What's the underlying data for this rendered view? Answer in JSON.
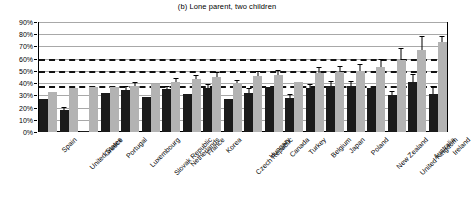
{
  "chart_data": {
    "type": "bar",
    "title": "(b) Lone parent, two children",
    "xlabel": "",
    "ylabel": "",
    "ylim": [
      0,
      90
    ],
    "ytick_labels": [
      "0%",
      "10%",
      "20%",
      "30%",
      "40%",
      "50%",
      "60%",
      "70%",
      "80%",
      "90%"
    ],
    "ytick_values": [
      0,
      10,
      20,
      30,
      40,
      50,
      60,
      70,
      80,
      90
    ],
    "grid": true,
    "legend_position": "none",
    "reference_lines": [
      {
        "value": 60,
        "style": "dashed"
      },
      {
        "value": 50,
        "style": "dashed"
      },
      {
        "value": 38,
        "style": "dashed"
      }
    ],
    "categories": [
      "Spain",
      "United States",
      "Greece",
      "Portugal",
      "Luxembourg",
      "Slovak Republic",
      "Netherlands",
      "France",
      "Korea",
      "Czech Republic",
      "Hungary",
      "Canada",
      "Turkey",
      "Belgium",
      "Japan",
      "Poland",
      "New Zealand",
      "United Kingdom",
      "Australia",
      "Ireland"
    ],
    "series": [
      {
        "name": "dark",
        "color": "#1b1b1b",
        "values": [
          27,
          18,
          1,
          32,
          34,
          29,
          35,
          31,
          36,
          27,
          32,
          37,
          28,
          36,
          38,
          38,
          36,
          30,
          41,
          31
        ],
        "errors": [
          0,
          1.5,
          0,
          0,
          2.5,
          0,
          1.5,
          0,
          2.5,
          0,
          3,
          0,
          2.5,
          2.5,
          3,
          3,
          0,
          2.5,
          6,
          6
        ]
      },
      {
        "name": "light",
        "color": "#b3b3b3",
        "values": [
          33,
          36,
          37,
          37,
          38,
          39,
          41,
          43,
          45,
          40,
          46,
          47,
          41,
          48,
          49,
          50,
          53,
          59,
          67,
          74
        ],
        "errors": [
          0,
          0,
          0,
          0,
          2,
          0,
          2,
          3,
          3,
          2,
          3,
          3,
          0,
          4,
          4,
          5,
          6,
          9,
          11,
          4
        ]
      }
    ]
  }
}
